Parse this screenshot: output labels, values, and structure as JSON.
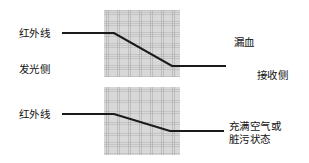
{
  "diagram": {
    "line_color": "#1a1a1a",
    "grid_fill": "#d8d8d8",
    "panels": [
      {
        "name": "blood-leak-condition",
        "left_label_ray": "红外线",
        "left_label_side": "发光侧",
        "right_label_condition": "漏血",
        "right_label_side": "接收侧",
        "ray_description": "flat then steep downward slope through medium"
      },
      {
        "name": "air-or-dirty-condition",
        "left_label_ray": "红外线",
        "right_label_condition_line1": "充满空气或",
        "right_label_condition_line2": "脏污状态",
        "ray_description": "flat then shallow downward slope through medium"
      }
    ]
  },
  "labels": {
    "ir_top": "红外线",
    "emitter_side": "发光侧",
    "ir_bottom": "红外线",
    "blood_leak": "漏血",
    "receiver_side": "接收侧",
    "air_or_dirty": "充满空气或\n脏污状态"
  },
  "rays": {
    "top_path": "M 62,33 L 114,33 L 172,66 L 226,66",
    "bottom_path": "M 62,114 L 114,114 L 170,131 L 224,131"
  }
}
